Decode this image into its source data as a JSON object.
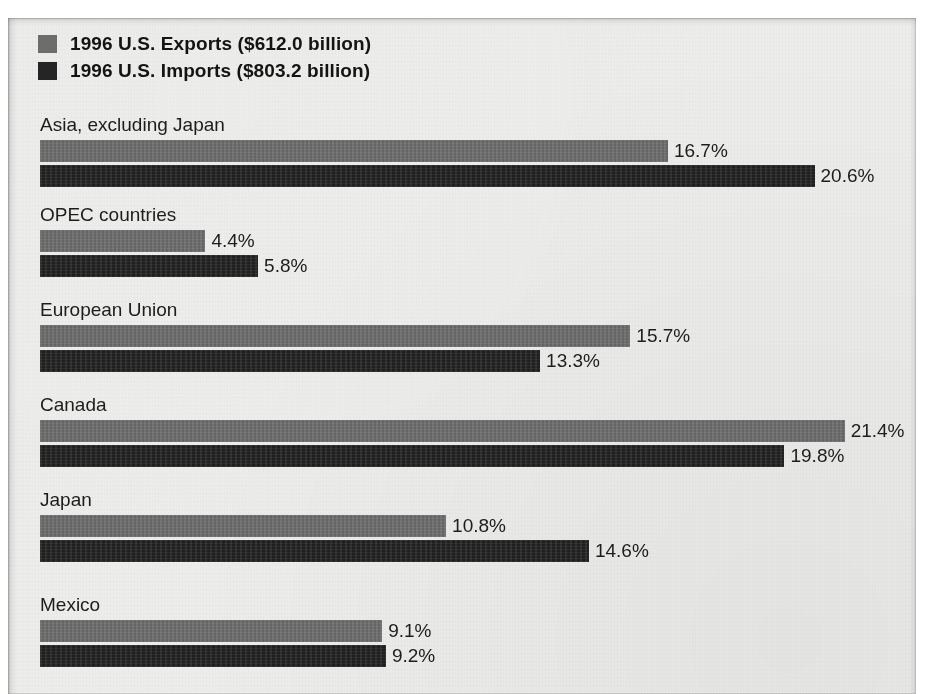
{
  "legend": {
    "items": [
      {
        "label": "1996 U.S. Exports ($612.0 billion)",
        "series": "exports",
        "color": "#6d6d6d"
      },
      {
        "label": "1996 U.S. Imports ($803.2 billion)",
        "series": "imports",
        "color": "#252525"
      }
    ]
  },
  "chart_data": {
    "type": "bar",
    "orientation": "horizontal",
    "title": "",
    "subtitle": "",
    "xlabel": "",
    "ylabel": "",
    "grid": false,
    "legend_position": "top-left",
    "value_suffix": "%",
    "axis_origin_px": 32,
    "px_per_unit": 37.6,
    "categories": [
      "Asia, excluding Japan",
      "OPEC countries",
      "European Union",
      "Canada",
      "Japan",
      "Mexico"
    ],
    "series": [
      {
        "name": "1996 U.S. Exports ($612.0 billion)",
        "short_name": "Exports",
        "color": "#6d6d6d",
        "values": [
          16.7,
          15.7,
          15.7,
          21.4,
          10.8,
          9.1
        ],
        "labels": [
          "16.7%",
          "4.4%",
          "15.7%",
          "21.4%",
          "10.8%",
          "9.1%"
        ]
      },
      {
        "name": "1996 U.S. Imports ($803.2 billion)",
        "short_name": "Imports",
        "color": "#232323",
        "values": [
          20.6,
          5.8,
          13.3,
          19.8,
          14.6,
          9.2
        ],
        "labels": [
          "20.6%",
          "5.8%",
          "13.3%",
          "19.8%",
          "14.6%",
          "9.2%"
        ]
      }
    ],
    "groups": [
      {
        "category": "Asia, excluding Japan",
        "exports": {
          "value": 16.7,
          "label": "16.7%"
        },
        "imports": {
          "value": 20.6,
          "label": "20.6%"
        }
      },
      {
        "category": "OPEC countries",
        "exports": {
          "value": 4.4,
          "label": "4.4%"
        },
        "imports": {
          "value": 5.8,
          "label": "5.8%"
        }
      },
      {
        "category": "European Union",
        "exports": {
          "value": 15.7,
          "label": "15.7%"
        },
        "imports": {
          "value": 13.3,
          "label": "13.3%"
        }
      },
      {
        "category": "Canada",
        "exports": {
          "value": 21.4,
          "label": "21.4%"
        },
        "imports": {
          "value": 19.8,
          "label": "19.8%"
        }
      },
      {
        "category": "Japan",
        "exports": {
          "value": 10.8,
          "label": "10.8%"
        },
        "imports": {
          "value": 14.6,
          "label": "14.6%"
        }
      },
      {
        "category": "Mexico",
        "exports": {
          "value": 9.1,
          "label": "9.1%"
        },
        "imports": {
          "value": 9.2,
          "label": "9.2%"
        }
      }
    ]
  },
  "layout": {
    "group_tops": [
      96,
      186,
      281,
      376,
      471,
      576
    ]
  }
}
